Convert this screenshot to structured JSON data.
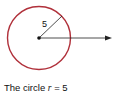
{
  "diagram": {
    "radius_label": "5",
    "circle_color": "#b0303a",
    "line_color": "#222222"
  },
  "caption": {
    "prefix": "The circle ",
    "variable": "r",
    "suffix": " = 5"
  }
}
